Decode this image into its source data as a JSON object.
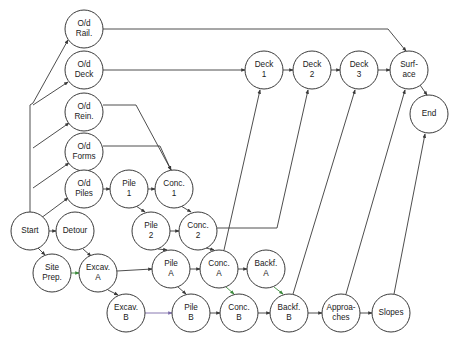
{
  "diagram": {
    "type": "directed-node-link-graph",
    "width": 462,
    "height": 342,
    "background_color": "#ffffff",
    "node_fill": "#ffffff",
    "node_stroke": "#3a3a3a",
    "edge_color": "#3a3a3a",
    "highlight_green": "#3a8a3a",
    "highlight_purple": "#7a6aa8",
    "node_radius": 19
  },
  "nodes": [
    {
      "id": "start",
      "label": "Start",
      "lines": [
        "Start"
      ],
      "cx": 30,
      "cy": 231
    },
    {
      "id": "detour",
      "label": "Detour",
      "lines": [
        "Detour"
      ],
      "cx": 75,
      "cy": 231
    },
    {
      "id": "siteprep",
      "label": "Site Prep.",
      "lines": [
        "Site",
        "Prep."
      ],
      "cx": 52,
      "cy": 273
    },
    {
      "id": "odrail",
      "label": "O/d Rail.",
      "lines": [
        "O/d",
        "Rail."
      ],
      "cx": 84,
      "cy": 29
    },
    {
      "id": "oddeck",
      "label": "O/d Deck",
      "lines": [
        "O/d",
        "Deck"
      ],
      "cx": 84,
      "cy": 70
    },
    {
      "id": "odrein",
      "label": "O/d Rein.",
      "lines": [
        "O/d",
        "Rein."
      ],
      "cx": 84,
      "cy": 112
    },
    {
      "id": "odforms",
      "label": "O/d Forms",
      "lines": [
        "O/d",
        "Forms"
      ],
      "cx": 84,
      "cy": 152
    },
    {
      "id": "odpiles",
      "label": "O/d Piles",
      "lines": [
        "O/d",
        "Piles"
      ],
      "cx": 84,
      "cy": 189
    },
    {
      "id": "pile1",
      "label": "Pile 1",
      "lines": [
        "Pile",
        "1"
      ],
      "cx": 129,
      "cy": 189
    },
    {
      "id": "conc1",
      "label": "Conc. 1",
      "lines": [
        "Conc.",
        "1"
      ],
      "cx": 174,
      "cy": 189
    },
    {
      "id": "pile2",
      "label": "Pile 2",
      "lines": [
        "Pile",
        "2"
      ],
      "cx": 151,
      "cy": 231
    },
    {
      "id": "conc2",
      "label": "Conc. 2",
      "lines": [
        "Conc.",
        "2"
      ],
      "cx": 198,
      "cy": 231
    },
    {
      "id": "excava",
      "label": "Excav. A",
      "lines": [
        "Excav.",
        "A"
      ],
      "cx": 98,
      "cy": 273
    },
    {
      "id": "pilea",
      "label": "Pile A",
      "lines": [
        "Pile",
        "A"
      ],
      "cx": 171,
      "cy": 269
    },
    {
      "id": "conca",
      "label": "Conc. A",
      "lines": [
        "Conc.",
        "A"
      ],
      "cx": 219,
      "cy": 269
    },
    {
      "id": "backfa",
      "label": "Backf. A",
      "lines": [
        "Backf.",
        "A"
      ],
      "cx": 266,
      "cy": 269
    },
    {
      "id": "excavb",
      "label": "Excav. B",
      "lines": [
        "Excav.",
        "B"
      ],
      "cx": 126,
      "cy": 313
    },
    {
      "id": "pileb",
      "label": "Pile B",
      "lines": [
        "Pile",
        "B"
      ],
      "cx": 191,
      "cy": 313
    },
    {
      "id": "concb",
      "label": "Conc. B",
      "lines": [
        "Conc.",
        "B"
      ],
      "cx": 239,
      "cy": 313
    },
    {
      "id": "backfb",
      "label": "Backf. B",
      "lines": [
        "Backf.",
        "B"
      ],
      "cx": 289,
      "cy": 313
    },
    {
      "id": "approaches",
      "label": "Approa-ches",
      "lines": [
        "Approa-",
        "ches"
      ],
      "cx": 341,
      "cy": 313
    },
    {
      "id": "slopes",
      "label": "Slopes",
      "lines": [
        "Slopes"
      ],
      "cx": 391,
      "cy": 313
    },
    {
      "id": "deck1",
      "label": "Deck 1",
      "lines": [
        "Deck",
        "1"
      ],
      "cx": 264,
      "cy": 70
    },
    {
      "id": "deck2",
      "label": "Deck 2",
      "lines": [
        "Deck",
        "2"
      ],
      "cx": 312,
      "cy": 70
    },
    {
      "id": "deck3",
      "label": "Deck 3",
      "lines": [
        "Deck",
        "3"
      ],
      "cx": 359,
      "cy": 70
    },
    {
      "id": "surface",
      "label": "Surf-ace",
      "lines": [
        "Surf-",
        "ace"
      ],
      "cx": 409,
      "cy": 70
    },
    {
      "id": "end",
      "label": "End",
      "lines": [
        "End"
      ],
      "cx": 429,
      "cy": 114
    }
  ],
  "edges": [
    {
      "from": "start",
      "to": "odrail",
      "color": "#3a3a3a",
      "path": "M 30 212 L 30 105 L 33 103 L 68 40"
    },
    {
      "from": "start",
      "to": "oddeck",
      "color": "#3a3a3a",
      "path": "M 33 105 L 68 82"
    },
    {
      "from": "start",
      "to": "odrein",
      "color": "#3a3a3a",
      "path": "M 33 148 L 69 123"
    },
    {
      "from": "start",
      "to": "odforms",
      "color": "#3a3a3a",
      "path": "M 33 188 L 69 163"
    },
    {
      "from": "start",
      "to": "odpiles",
      "color": "#3a3a3a",
      "path": "M 33 224 L 68 198"
    },
    {
      "from": "start",
      "to": "detour",
      "color": "#3a3a3a",
      "path": "M 49 231 L 56 231"
    },
    {
      "from": "start",
      "to": "siteprep",
      "color": "#3a3a3a",
      "path": "M 38 248 L 45 255"
    },
    {
      "from": "siteprep",
      "to": "excava",
      "color": "#3a8a3a",
      "path": "M 71 273 L 79 273"
    },
    {
      "from": "detour",
      "to": "excava",
      "color": "#3a3a3a",
      "path": "M 83 249 L 91 256"
    },
    {
      "from": "odpiles",
      "to": "pile1",
      "color": "#3a3a3a",
      "path": "M 103 189 L 110 189"
    },
    {
      "from": "pile1",
      "to": "conc1",
      "color": "#3a3a3a",
      "path": "M 148 189 L 155 189"
    },
    {
      "from": "pile1",
      "to": "pile2",
      "color": "#3a3a3a",
      "path": "M 136 206 L 145 212"
    },
    {
      "from": "conc1",
      "to": "conc2",
      "color": "#3a3a3a",
      "path": "M 181 206 L 191 212"
    },
    {
      "from": "pile2",
      "to": "conc2",
      "color": "#3a3a3a",
      "path": "M 170 231 L 179 231"
    },
    {
      "from": "pile2",
      "to": "pilea",
      "color": "#3a3a3a",
      "path": "M 158 249 L 167 250"
    },
    {
      "from": "conc2",
      "to": "conca",
      "color": "#3a3a3a",
      "path": "M 206 248 L 214 250"
    },
    {
      "from": "odrein",
      "to": "conc1",
      "color": "#3a3a3a",
      "path": "M 103 105 L 136 105 L 171 170"
    },
    {
      "from": "odforms",
      "to": "conc1",
      "color": "#3a3a3a",
      "path": "M 103 146 L 160 146 L 171 170"
    },
    {
      "from": "odrail",
      "to": "surface",
      "color": "#3a3a3a",
      "path": "M 103 29 L 388 29 L 406 51"
    },
    {
      "from": "oddeck",
      "to": "deck1",
      "color": "#3a3a3a",
      "path": "M 103 70 L 245 70"
    },
    {
      "from": "excava",
      "to": "pilea",
      "color": "#3a3a3a",
      "path": "M 117 271 L 152 269"
    },
    {
      "from": "excava",
      "to": "excavb",
      "color": "#3a3a3a",
      "path": "M 108 290 L 118 295"
    },
    {
      "from": "pilea",
      "to": "conca",
      "color": "#3a3a3a",
      "path": "M 190 269 L 200 269"
    },
    {
      "from": "conca",
      "to": "backfa",
      "color": "#3a3a3a",
      "path": "M 238 269 L 247 269"
    },
    {
      "from": "pilea",
      "to": "pileb",
      "color": "#3a3a3a",
      "path": "M 178 287 L 186 294"
    },
    {
      "from": "conca",
      "to": "concb",
      "color": "#3a8a3a",
      "path": "M 226 287 L 234 294"
    },
    {
      "from": "backfa",
      "to": "backfb",
      "color": "#3a8a3a",
      "path": "M 274 287 L 283 294"
    },
    {
      "from": "excavb",
      "to": "pileb",
      "color": "#7a6aa8",
      "path": "M 145 313 L 172 313"
    },
    {
      "from": "pileb",
      "to": "concb",
      "color": "#3a3a3a",
      "path": "M 210 313 L 220 313"
    },
    {
      "from": "concb",
      "to": "backfb",
      "color": "#3a3a3a",
      "path": "M 258 313 L 270 313"
    },
    {
      "from": "backfb",
      "to": "approaches",
      "color": "#3a3a3a",
      "path": "M 308 313 L 322 313"
    },
    {
      "from": "approaches",
      "to": "slopes",
      "color": "#3a3a3a",
      "path": "M 360 313 L 372 313"
    },
    {
      "from": "conca",
      "to": "deck1",
      "color": "#3a3a3a",
      "path": "M 224 250 L 260 90"
    },
    {
      "from": "conc2",
      "to": "deck2",
      "color": "#3a3a3a",
      "path": "M 217 228 L 277 228 L 308 90"
    },
    {
      "from": "backfb",
      "to": "deck3",
      "color": "#3a3a3a",
      "path": "M 293 294 L 355 90"
    },
    {
      "from": "approaches",
      "to": "surface",
      "color": "#3a3a3a",
      "path": "M 346 294 L 405 90"
    },
    {
      "from": "slopes",
      "to": "end",
      "color": "#3a3a3a",
      "path": "M 394 294 L 425 134"
    },
    {
      "from": "deck1",
      "to": "deck2",
      "color": "#3a3a3a",
      "path": "M 283 70 L 293 70"
    },
    {
      "from": "deck2",
      "to": "deck3",
      "color": "#3a3a3a",
      "path": "M 331 70 L 340 70"
    },
    {
      "from": "deck3",
      "to": "surface",
      "color": "#3a3a3a",
      "path": "M 378 70 L 390 70"
    },
    {
      "from": "surface",
      "to": "end",
      "color": "#3a3a3a",
      "path": "M 420 85 L 427 95"
    }
  ]
}
